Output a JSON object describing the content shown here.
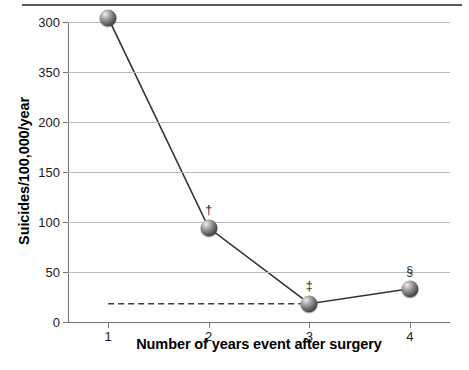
{
  "chart_data": {
    "type": "line",
    "title": "",
    "xlabel": "Number of years event after surgery",
    "ylabel": "Suicides/100,000/year",
    "x": [
      1,
      2,
      3,
      4
    ],
    "xtick_labels": [
      "1",
      "2",
      "3",
      "4"
    ],
    "values": [
      365,
      113,
      22,
      40
    ],
    "point_annotations": [
      "*",
      "†",
      "‡",
      "§"
    ],
    "ytick_labels": [
      "300",
      "350",
      "200",
      "150",
      "100",
      "50",
      "0"
    ],
    "ytick_positions": [
      300,
      250,
      200,
      150,
      100,
      50,
      0
    ],
    "ylim": [
      0,
      300
    ],
    "xlim": [
      0.6,
      4.4
    ],
    "grid": true,
    "legend": null,
    "reference_line": {
      "value": 22,
      "style": "dashed",
      "x_start": 1,
      "x_end": 3
    },
    "series": [
      {
        "name": "Suicides per 100,000 per year",
        "values": [
          365,
          113,
          22,
          40
        ]
      }
    ],
    "colors": {
      "line": "#333333",
      "marker": "#4a4a4a",
      "grid": "#b8bbbe",
      "axis": "#6f7479",
      "text": "#1b1b1b",
      "top_rule": "#555a5e"
    }
  }
}
